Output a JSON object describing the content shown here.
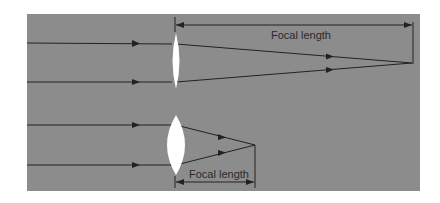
{
  "diagram": {
    "background_color": "#8c8c8c",
    "lens_color": "#ffffff",
    "ray_color": "#222222",
    "lenses": [
      {
        "name": "thin-lens",
        "center_x": 176,
        "top_y": 33,
        "bottom_y": 89,
        "half_width": 4,
        "rays_y": [
          43,
          82
        ],
        "focal_point": [
          412,
          63
        ],
        "dimension_label": "Focal length",
        "dimension_y": 25,
        "label_position": "above-rays"
      },
      {
        "name": "thick-lens",
        "center_x": 176,
        "top_y": 115,
        "bottom_y": 175,
        "half_width": 9,
        "rays_y": [
          125,
          165
        ],
        "focal_point": [
          255,
          145
        ],
        "dimension_label": "Focal length",
        "dimension_y": 182,
        "label_position": "below-lens"
      }
    ]
  }
}
